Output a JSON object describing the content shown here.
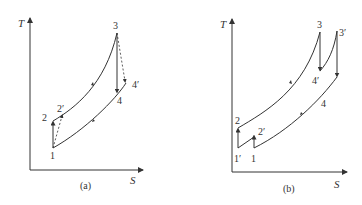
{
  "figure": {
    "panels": [
      {
        "caption": "(a)",
        "y_axis_label": "T",
        "x_axis_label": "S",
        "points": {
          "p1": "1",
          "p2": "2",
          "p2p": "2′",
          "p3": "3",
          "p4": "4",
          "p4p": "4′"
        }
      },
      {
        "caption": "(b)",
        "y_axis_label": "T",
        "x_axis_label": "S",
        "points": {
          "p1p": "1′",
          "p1": "1",
          "p2": "2",
          "p2p": "2′",
          "p3": "3",
          "p3p": "3′",
          "p4": "4",
          "p4p": "4′"
        }
      }
    ],
    "colors": {
      "line": "#333333",
      "background": "#ffffff"
    }
  }
}
